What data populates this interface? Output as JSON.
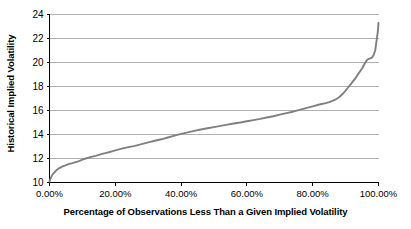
{
  "chart_data": {
    "type": "line",
    "title": "",
    "xlabel": "Percentage of Observations Less Than a Given Implied Volatility",
    "ylabel": "Historical Implied Volatility",
    "xlim": [
      0,
      100
    ],
    "ylim": [
      10,
      24
    ],
    "grid": true,
    "grid_axis": "y",
    "legend": "none",
    "line_color": "#808080",
    "axis_color": "#000000",
    "grid_color": "#b0b0b0",
    "x_tick_labels": [
      "0.00%",
      "20.00%",
      "40.00%",
      "60.00%",
      "80.00%",
      "100.00%"
    ],
    "x_tick_values": [
      0,
      20,
      40,
      60,
      80,
      100
    ],
    "y_tick_labels": [
      "10",
      "12",
      "14",
      "16",
      "18",
      "20",
      "22",
      "24"
    ],
    "y_tick_values": [
      10,
      12,
      14,
      16,
      18,
      20,
      22,
      24
    ],
    "series": [
      {
        "name": "Historical Implied Volatility Quantiles",
        "x": [
          0,
          0.5,
          1,
          1.5,
          2,
          2.5,
          3,
          4,
          5,
          6,
          7,
          8,
          9,
          10,
          11,
          12,
          13,
          14,
          15,
          16,
          17,
          18,
          19,
          20,
          22,
          24,
          26,
          28,
          30,
          32,
          34,
          36,
          38,
          40,
          42,
          44,
          46,
          48,
          50,
          52,
          54,
          56,
          58,
          60,
          62,
          64,
          66,
          68,
          70,
          72,
          74,
          76,
          78,
          80,
          82,
          84,
          85,
          86,
          87,
          88,
          89,
          90,
          91,
          92,
          93,
          94,
          95,
          95.5,
          96,
          96.5,
          97,
          97.5,
          98,
          98.5,
          99,
          99.3,
          99.6,
          99.8,
          100
        ],
        "y": [
          10.1,
          10.45,
          10.7,
          10.85,
          11.0,
          11.1,
          11.2,
          11.35,
          11.45,
          11.55,
          11.62,
          11.7,
          11.78,
          11.9,
          12.0,
          12.08,
          12.15,
          12.22,
          12.3,
          12.38,
          12.45,
          12.52,
          12.6,
          12.68,
          12.82,
          12.95,
          13.05,
          13.2,
          13.35,
          13.48,
          13.6,
          13.75,
          13.9,
          14.05,
          14.18,
          14.3,
          14.42,
          14.52,
          14.62,
          14.72,
          14.82,
          14.92,
          15.0,
          15.1,
          15.2,
          15.3,
          15.42,
          15.52,
          15.65,
          15.78,
          15.9,
          16.05,
          16.2,
          16.35,
          16.5,
          16.62,
          16.7,
          16.8,
          16.92,
          17.1,
          17.35,
          17.65,
          18.0,
          18.35,
          18.7,
          19.1,
          19.5,
          19.75,
          20.0,
          20.2,
          20.3,
          20.35,
          20.4,
          20.6,
          21.0,
          21.6,
          22.2,
          22.6,
          23.3
        ]
      }
    ]
  },
  "axes": {
    "y_title": "Historical Implied Volatility",
    "x_title": "Percentage of Observations Less Than a Given Implied Volatility"
  }
}
